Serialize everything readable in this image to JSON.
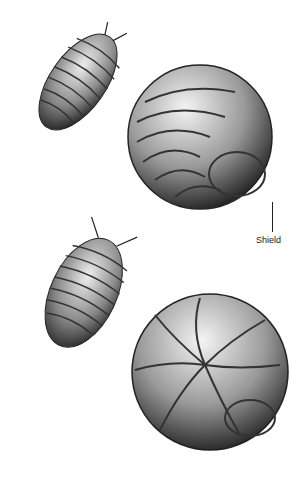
{
  "illustration": {
    "subject": "pill bugs (isopods), extended and rolled",
    "figures": [
      {
        "name": "pillbug-extended-top",
        "state": "extended"
      },
      {
        "name": "pillbug-rolled-top",
        "state": "rolled"
      },
      {
        "name": "pillbug-extended-bottom",
        "state": "extended"
      },
      {
        "name": "pillbug-rolled-bottom",
        "state": "rolled"
      }
    ],
    "labels": {
      "shield": "Shield"
    }
  }
}
